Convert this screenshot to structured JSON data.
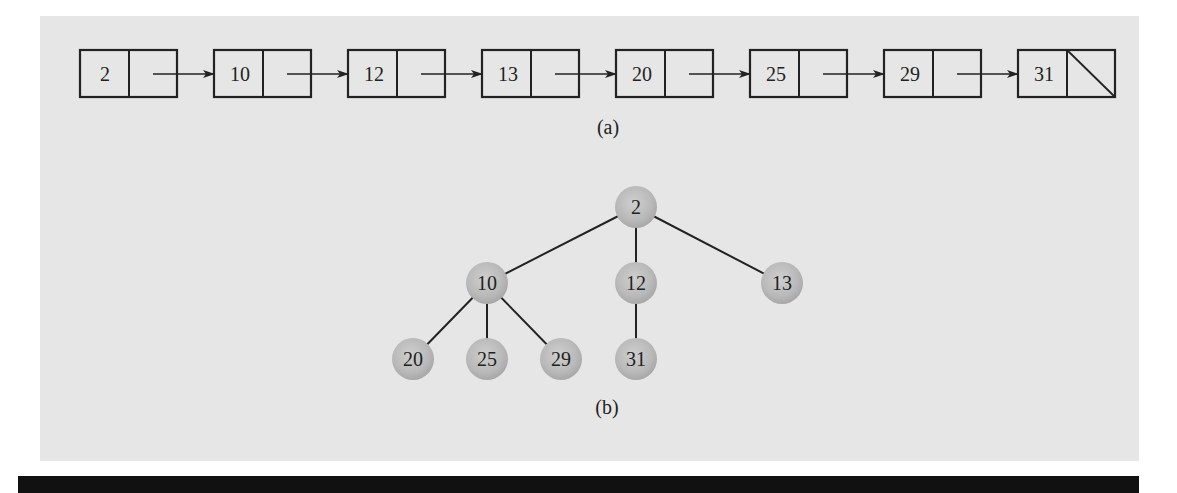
{
  "figure": {
    "background_color": "#e6e6e6",
    "line_color": "#222222",
    "node_fill": "#b9b9b9",
    "part_a": {
      "caption": "(a)",
      "type": "singly-linked-list",
      "nodes": [
        {
          "value": "2"
        },
        {
          "value": "10"
        },
        {
          "value": "12"
        },
        {
          "value": "13"
        },
        {
          "value": "20"
        },
        {
          "value": "25"
        },
        {
          "value": "29"
        },
        {
          "value": "31",
          "next": "null"
        }
      ]
    },
    "part_b": {
      "caption": "(b)",
      "type": "tree",
      "nodes": [
        {
          "id": "n2",
          "value": "2",
          "x": 636,
          "y": 207
        },
        {
          "id": "n10",
          "value": "10",
          "x": 487,
          "y": 283
        },
        {
          "id": "n12",
          "value": "12",
          "x": 636,
          "y": 283
        },
        {
          "id": "n13",
          "value": "13",
          "x": 782,
          "y": 283
        },
        {
          "id": "n20",
          "value": "20",
          "x": 413,
          "y": 359
        },
        {
          "id": "n25",
          "value": "25",
          "x": 487,
          "y": 359
        },
        {
          "id": "n29",
          "value": "29",
          "x": 561,
          "y": 359
        },
        {
          "id": "n31",
          "value": "31",
          "x": 636,
          "y": 359
        }
      ],
      "edges": [
        [
          "n2",
          "n10"
        ],
        [
          "n2",
          "n12"
        ],
        [
          "n2",
          "n13"
        ],
        [
          "n10",
          "n20"
        ],
        [
          "n10",
          "n25"
        ],
        [
          "n10",
          "n29"
        ],
        [
          "n12",
          "n31"
        ]
      ]
    }
  }
}
